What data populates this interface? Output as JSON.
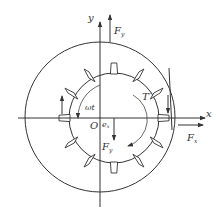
{
  "figure": {
    "width": 220,
    "height": 217,
    "colors": {
      "line": "#333333",
      "background": "#ffffff"
    }
  },
  "labels": {
    "y_axis": "y",
    "x_axis": "x",
    "origin": "O",
    "force_y_top": {
      "main": "F",
      "sub": "y"
    },
    "force_x": {
      "main": "F",
      "sub": "x"
    },
    "force_y_down": {
      "main": "F",
      "sub": "y"
    },
    "omega_t": "ωt",
    "eccentricity": {
      "main": "e",
      "sub": "x"
    },
    "torque": "T′"
  },
  "geometry": {
    "stator": {
      "cx": 100,
      "cy": 117,
      "r": 75
    },
    "rotor": {
      "cx": 114,
      "cy": 118,
      "r": 45
    },
    "teeth_count": 12,
    "y_axis": {
      "x": 100,
      "y1": 207,
      "y2": 20
    },
    "x_axis": {
      "y": 118,
      "x1": 18,
      "x2": 206
    }
  }
}
